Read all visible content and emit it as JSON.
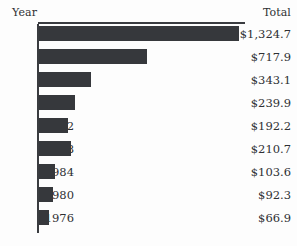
{
  "chart_data": {
    "type": "bar",
    "orientation": "horizontal",
    "title": "",
    "xlabel": "",
    "ylabel": "Year",
    "categories": [
      "2008",
      "2004",
      "2000",
      "1996",
      "1992",
      "1988",
      "1984",
      "1980",
      "1976"
    ],
    "values": [
      1324.7,
      717.9,
      343.1,
      239.9,
      192.2,
      210.7,
      103.6,
      92.3,
      66.9
    ],
    "value_labels": [
      "$1,324.7",
      "$717.9",
      "$343.1",
      "$239.9",
      "$192.2",
      "$210.7",
      "$103.6",
      "$92.3",
      "$66.9"
    ],
    "series": [
      {
        "name": "Total",
        "values": [
          1324.7,
          717.9,
          343.1,
          239.9,
          192.2,
          210.7,
          103.6,
          92.3,
          66.9
        ]
      }
    ],
    "xlim": [
      0,
      1324.7
    ],
    "grid": false,
    "legend": false,
    "bar_color": "#36383c",
    "axis_color": "#3a3c40",
    "background_color": "#fdfdfd"
  },
  "columns": {
    "year_header": "Year",
    "total_header": "Total"
  },
  "rows": [
    {
      "year": "2008",
      "total": "$1,324.7",
      "value": 1324.7
    },
    {
      "year": "2004",
      "total": "$717.9",
      "value": 717.9
    },
    {
      "year": "2000",
      "total": "$343.1",
      "value": 343.1
    },
    {
      "year": "1996",
      "total": "$239.9",
      "value": 239.9
    },
    {
      "year": "1992",
      "total": "$192.2",
      "value": 192.2
    },
    {
      "year": "1988",
      "total": "$210.7",
      "value": 210.7
    },
    {
      "year": "1984",
      "total": "$103.6",
      "value": 103.6
    },
    {
      "year": "1980",
      "total": "$92.3",
      "value": 92.3
    },
    {
      "year": "1976",
      "total": "$66.9",
      "value": 66.9
    }
  ],
  "scale": {
    "max_value": 1324.7,
    "max_bar_px": 200
  }
}
